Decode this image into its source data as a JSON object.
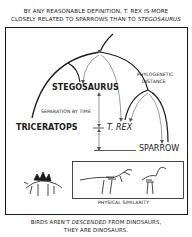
{
  "comic": {
    "title_line1": "By any reasonable definition, T. Rex is more",
    "title_line2_a": "closely related to sparrows than to ",
    "title_line2_b": "Stegosaurus",
    "labels": {
      "stegosaurus": "Stegosaurus",
      "triceratops": "Triceratops",
      "trex": "T. Rex",
      "sparrow": "Sparrow",
      "separation_by_time": "Separation by time",
      "phylogenetic_1": "Phylogenetic",
      "phylogenetic_2": "Distance",
      "physical_similarity": "Physical similarity"
    },
    "caption_line1_a": "Birds aren't ",
    "caption_line1_b": "descended",
    "caption_line1_c": " from dinosaurs,",
    "caption_line2": "they are dinosaurs.",
    "colors": {
      "ink": "#1a1a1a",
      "background": "#ffffff",
      "arrow": "#555555"
    }
  }
}
